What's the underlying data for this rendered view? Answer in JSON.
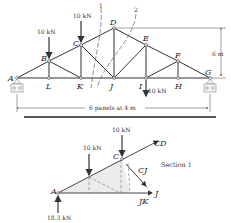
{
  "truss": {
    "nodes": {
      "A": "A",
      "B": "B",
      "C": "C",
      "D": "D",
      "E": "E",
      "F": "F",
      "G": "G",
      "L": "L",
      "K": "K",
      "J": "J",
      "I": "I",
      "H": "H"
    },
    "loads": {
      "B": "10 kN",
      "C": "10 kN",
      "I": "10 kN"
    },
    "section_labels": [
      "1",
      "2"
    ],
    "height_dim": "6 m",
    "span_dim": "6 panels at 4 m"
  },
  "free_body": {
    "nodes": {
      "A": "A",
      "C": "C",
      "J": "J"
    },
    "loads": [
      "10 kN",
      "10 kN"
    ],
    "reaction": "18.3 kN",
    "forces": {
      "CD": "CD",
      "CJ": "CJ",
      "JK": "JK"
    },
    "title": "Section 1"
  },
  "colors": {
    "line": "#333333",
    "shade": "#e8e8e8"
  }
}
